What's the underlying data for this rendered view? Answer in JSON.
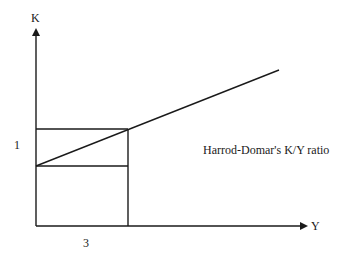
{
  "diagram": {
    "title": "Harrod-Domar's K/Y ratio",
    "y_axis_label": "K",
    "x_axis_label": "Y",
    "y_tick_label": "1",
    "x_tick_label": "3",
    "line_color": "#1a1a1a",
    "background": "#ffffff"
  }
}
